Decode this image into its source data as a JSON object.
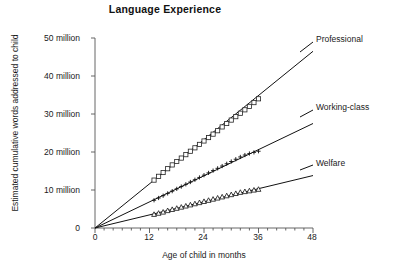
{
  "chart_data": {
    "type": "line",
    "title": "Language Experience",
    "xlabel": "Age of child in months",
    "ylabel": "Estimated cumulative words addressed to child",
    "xlim": [
      0,
      48
    ],
    "ylim": [
      0,
      50
    ],
    "grid": false,
    "legend_position": "right-inline-labels",
    "x_tick_labels": [
      "0",
      "12",
      "24",
      "36",
      "48"
    ],
    "x_ticks": [
      0,
      12,
      24,
      36,
      48
    ],
    "x_minor_tick_interval": 2,
    "y_tick_labels": [
      "0",
      "10 million",
      "20 million",
      "30 million",
      "40 million",
      "50 million"
    ],
    "y_ticks": [
      0,
      10,
      20,
      30,
      40,
      50
    ],
    "y_unit": "million words",
    "series": [
      {
        "name": "Professional",
        "marker": "open-square",
        "trend_line": {
          "from_x": 0,
          "from_y": 0,
          "to_x": 48,
          "to_y": 46.5
        },
        "slope_per_month": 0.97,
        "x": [
          13,
          14,
          15,
          16,
          17,
          18,
          19,
          20,
          21,
          22,
          23,
          24,
          25,
          26,
          27,
          28,
          29,
          30,
          31,
          32,
          33,
          34,
          35,
          36
        ],
        "values": [
          12.6,
          13.6,
          14.6,
          15.6,
          16.6,
          17.5,
          18.4,
          19.3,
          20.2,
          21.1,
          22.0,
          22.9,
          23.8,
          24.7,
          25.6,
          26.6,
          27.5,
          28.4,
          29.3,
          30.2,
          31.1,
          32.0,
          33.0,
          34.0
        ]
      },
      {
        "name": "Working-class",
        "marker": "plus",
        "trend_line": {
          "from_x": 0,
          "from_y": 0,
          "to_x": 48,
          "to_y": 27.5
        },
        "slope_per_month": 0.573,
        "x": [
          13,
          14,
          15,
          16,
          17,
          18,
          19,
          20,
          21,
          22,
          23,
          24,
          25,
          26,
          27,
          28,
          29,
          30,
          31,
          32,
          33,
          34,
          35,
          36
        ],
        "values": [
          7.3,
          7.9,
          8.5,
          9.1,
          9.7,
          10.3,
          10.9,
          11.5,
          12.1,
          12.7,
          13.3,
          13.9,
          14.5,
          15.1,
          15.7,
          16.3,
          16.9,
          17.5,
          18.1,
          18.7,
          19.2,
          19.6,
          19.9,
          20.2
        ]
      },
      {
        "name": "Welfare",
        "marker": "triangle",
        "trend_line": {
          "from_x": 0,
          "from_y": 0,
          "to_x": 48,
          "to_y": 13.8
        },
        "slope_per_month": 0.287,
        "x": [
          13,
          14,
          15,
          16,
          17,
          18,
          19,
          20,
          21,
          22,
          23,
          24,
          25,
          26,
          27,
          28,
          29,
          30,
          31,
          32,
          33,
          34,
          35,
          36
        ],
        "values": [
          3.6,
          3.9,
          4.2,
          4.6,
          4.9,
          5.2,
          5.5,
          5.8,
          6.1,
          6.4,
          6.7,
          7.0,
          7.3,
          7.6,
          7.9,
          8.2,
          8.5,
          8.8,
          9.1,
          9.4,
          9.6,
          9.8,
          10.0,
          10.2
        ]
      }
    ]
  },
  "series_labels": {
    "professional": "Professional",
    "working_class": "Working-class",
    "welfare": "Welfare"
  }
}
